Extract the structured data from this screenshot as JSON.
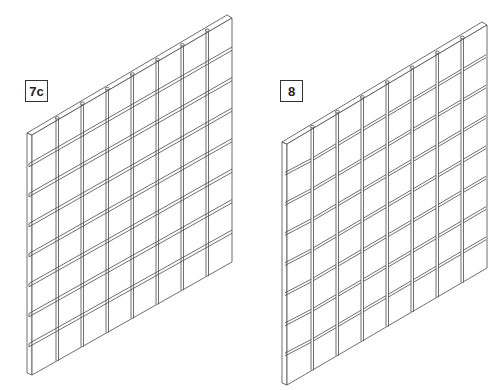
{
  "figure": {
    "panels": [
      {
        "id": "7c",
        "label": "7c",
        "label_pos": {
          "x": 25,
          "y": 80
        },
        "style": "continuous-rails",
        "corners": {
          "tl": [
            27,
            133
          ],
          "tr": [
            232,
            17
          ],
          "bl": [
            27,
            373
          ],
          "br": [
            232,
            262
          ]
        },
        "columns": 8,
        "rows": 8
      },
      {
        "id": "8",
        "label": "8",
        "label_pos": {
          "x": 280,
          "y": 80
        },
        "style": "segmented-rails",
        "corners": {
          "tl": [
            282,
            142
          ],
          "tr": [
            487,
            24
          ],
          "bl": [
            282,
            383
          ],
          "br": [
            487,
            268
          ]
        },
        "columns": 8,
        "rows": 8
      }
    ],
    "colors": {
      "line": "#4a4a4a",
      "background": "#ffffff",
      "face": "#ffffff"
    }
  }
}
